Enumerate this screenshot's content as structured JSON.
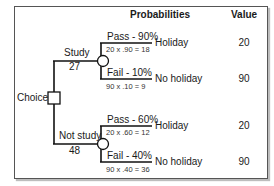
{
  "headers": {
    "probabilities": "Probabilities",
    "value": "Value"
  },
  "decision_node": {
    "label": "Choice",
    "shape": "square"
  },
  "branches": [
    {
      "name": "Study",
      "expected_value": "27",
      "chance_node": "circle",
      "outcomes": [
        {
          "probability_label": "Pass - 90%",
          "calculation": "20 x .90 = 18",
          "outcome": "Holiday",
          "value": "20"
        },
        {
          "probability_label": "Fail - 10%",
          "calculation": "90 x .10 = 9",
          "outcome": "No holiday",
          "value": "90"
        }
      ]
    },
    {
      "name": "Not study",
      "expected_value": "48",
      "chance_node": "circle",
      "outcomes": [
        {
          "probability_label": "Pass - 60%",
          "calculation": "20 x .60 = 12",
          "outcome": "Holiday",
          "value": "20"
        },
        {
          "probability_label": "Fail - 40%",
          "calculation": "90 x .40 = 36",
          "outcome": "No holiday",
          "value": "90"
        }
      ]
    }
  ],
  "colors": {
    "line": "#111111",
    "frame_border": "#555555",
    "background": "#ffffff"
  }
}
